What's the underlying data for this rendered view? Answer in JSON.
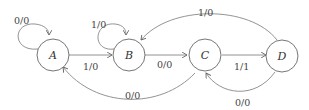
{
  "diagram": {
    "type": "state-machine",
    "states": [
      {
        "id": "A",
        "label": "A"
      },
      {
        "id": "B",
        "label": "B"
      },
      {
        "id": "C",
        "label": "C"
      },
      {
        "id": "D",
        "label": "D"
      }
    ],
    "transitions": [
      {
        "from": "A",
        "to": "A",
        "label": "0/0"
      },
      {
        "from": "A",
        "to": "B",
        "label": "1/0"
      },
      {
        "from": "B",
        "to": "B",
        "label": "1/0"
      },
      {
        "from": "B",
        "to": "C",
        "label": "0/0"
      },
      {
        "from": "C",
        "to": "D",
        "label": "1/1"
      },
      {
        "from": "C",
        "to": "A",
        "label": "0/0"
      },
      {
        "from": "D",
        "to": "B",
        "label": "1/0"
      },
      {
        "from": "D",
        "to": "C",
        "label": "0/0"
      }
    ]
  }
}
